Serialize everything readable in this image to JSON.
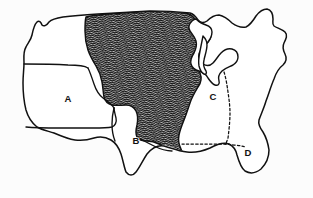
{
  "figure": {
    "width": 313,
    "height": 198,
    "background_color": "#fcfcfc",
    "line_color": "#111111",
    "hatch_color": "#111111"
  },
  "regions": [
    {
      "id": "region-a",
      "label": "A",
      "label_x": 68,
      "label_y": 99,
      "fill": "none",
      "description": "Western / Great Basin region"
    },
    {
      "id": "region-b",
      "label": "B",
      "label_x": 136,
      "label_y": 141,
      "fill": "none",
      "description": "Southwestern region"
    },
    {
      "id": "region-c",
      "label": "C",
      "label_x": 213,
      "label_y": 97,
      "fill": "none",
      "description": "East-central region"
    },
    {
      "id": "region-d",
      "label": "D",
      "label_x": 248,
      "label_y": 153,
      "fill": "none",
      "description": "Southeastern / Florida region"
    }
  ],
  "shaded_region": {
    "id": "region-hatched",
    "label": "",
    "pattern": "diagonal-hatch",
    "description": "Large central band running from the northern border down to the Gulf coast, filled with dense diagonal line hatching"
  },
  "boundaries": {
    "solid_count": 5,
    "dashed_count": 2,
    "dashed_description": "Dotted boundary separating region C from region D along the Gulf states, and a dotted north-south boundary east of region C"
  }
}
